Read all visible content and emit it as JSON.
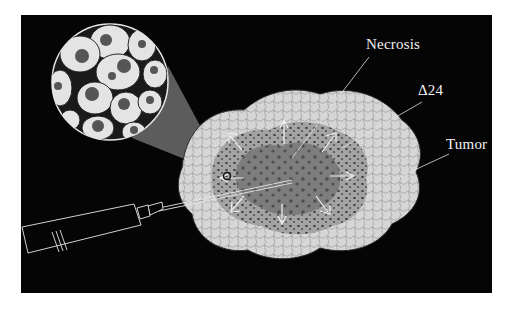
{
  "figure": {
    "background_color": "#050505",
    "labels": {
      "necrosis": "Necrosis",
      "delta24": "Δ24",
      "tumor": "Tumor"
    },
    "elements": {
      "magnified_cells": "magnified-infected-cells-inset",
      "syringe": "syringe",
      "tumor_mass": "tumor-mass",
      "necrotic_core": "necrotic-core",
      "spread_arrows_count": 10
    },
    "colors": {
      "tumor_outer": "#d9d9d9",
      "infected_zone": "#9a9a9a",
      "necrotic_core": "#6e6e6e",
      "label_text": "#f2f2f2"
    }
  }
}
